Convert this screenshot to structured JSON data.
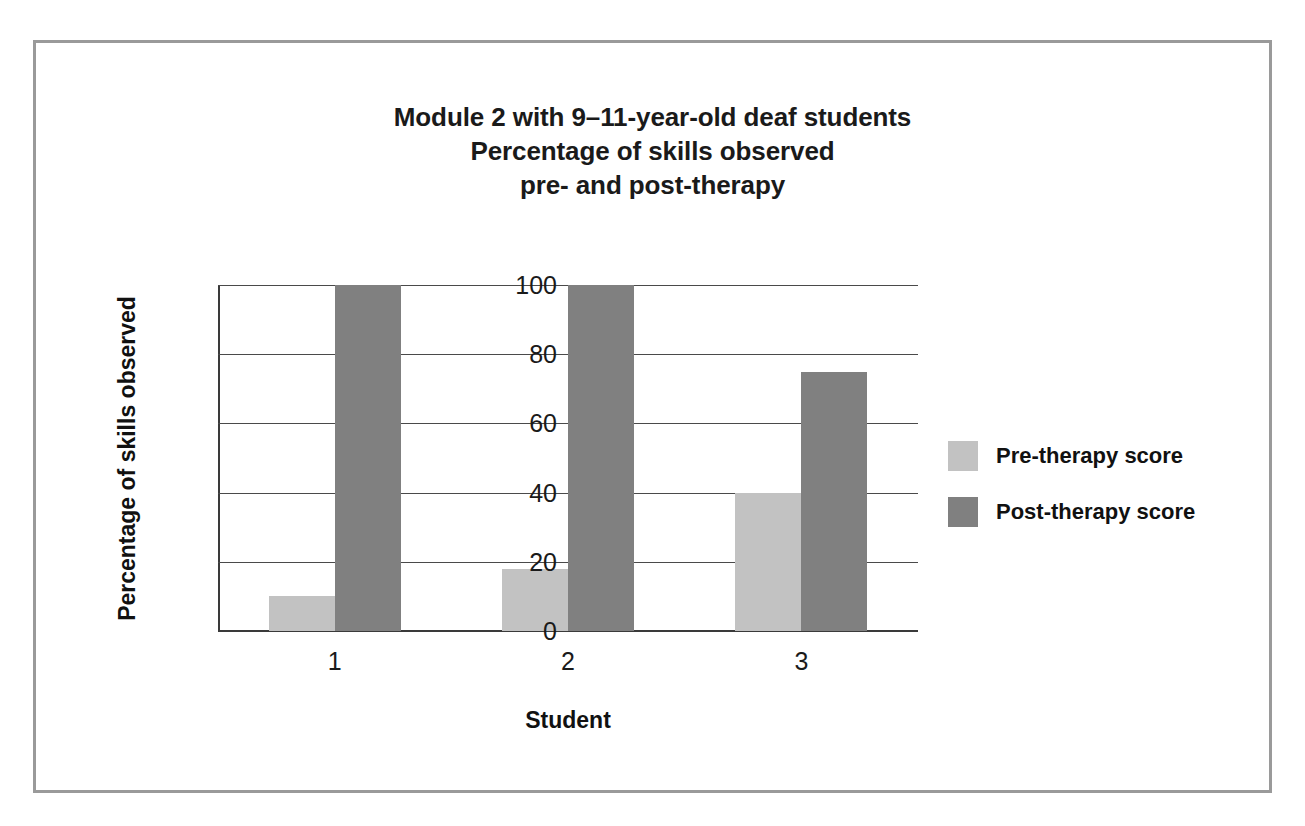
{
  "figure": {
    "frame_border_color": "#9a9a9a",
    "background": "#ffffff"
  },
  "chart_data": {
    "type": "bar",
    "title": "Module 2 with 9–11-year-old deaf students\nPercentage of skills observed\npre- and post-therapy",
    "title_lines": [
      "Module 2 with 9–11-year-old deaf students",
      "Percentage of skills observed",
      "pre- and post-therapy"
    ],
    "xlabel": "Student",
    "ylabel": "Percentage of skills observed",
    "categories": [
      "1",
      "2",
      "3"
    ],
    "ylim": [
      0,
      100
    ],
    "yticks": [
      0,
      20,
      40,
      60,
      80,
      100
    ],
    "ytick_labels": [
      "0",
      "20",
      "40",
      "60",
      "80",
      "100"
    ],
    "grid": true,
    "legend_position": "right",
    "series": [
      {
        "name": "Pre-therapy score",
        "color": "#c2c2c2",
        "values": [
          10,
          18,
          40
        ]
      },
      {
        "name": "Post-therapy score",
        "color": "#808080",
        "values": [
          100,
          100,
          75
        ]
      }
    ]
  }
}
